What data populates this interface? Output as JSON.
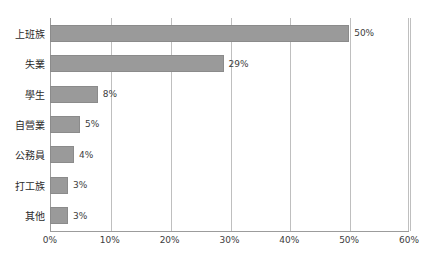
{
  "chart_data": {
    "type": "bar",
    "orientation": "horizontal",
    "title": "",
    "xlabel": "",
    "ylabel": "",
    "categories": [
      "上班族",
      "失業",
      "學生",
      "自營業",
      "公務員",
      "打工族",
      "其他"
    ],
    "values": [
      50,
      29,
      8,
      5,
      4,
      3,
      3
    ],
    "value_labels": [
      "50%",
      "29%",
      "8%",
      "5%",
      "4%",
      "3%",
      "3%"
    ],
    "xlim": [
      0,
      60
    ],
    "xticks": [
      0,
      10,
      20,
      30,
      40,
      50,
      60
    ],
    "xtick_labels": [
      "0%",
      "10%",
      "20%",
      "30%",
      "40%",
      "50%",
      "60%"
    ],
    "grid": true,
    "grid_axis": "x",
    "legend": false,
    "bar_color": "#9a9a9a",
    "bar_edge_color": "#8b8b8b",
    "gridline_color": "#bfbfbf",
    "axis_color": "#9c9c9c",
    "text_color": "#2b2b2b"
  }
}
